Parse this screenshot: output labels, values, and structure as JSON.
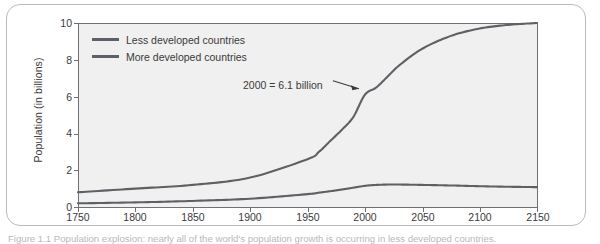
{
  "figure": {
    "caption": "Figure 1.1  Population explosion: nearly all of the world's population growth is occurring in less developed countries.",
    "frame_color": "#b9bcbe",
    "plot_background": "#f0f0f0",
    "axis_color": "#6e7073"
  },
  "chart_data": {
    "type": "line",
    "title": "",
    "xlabel": "",
    "ylabel": "Population (in billions)",
    "xlim": [
      1750,
      2150
    ],
    "ylim": [
      0,
      10
    ],
    "grid": false,
    "legend_position": "top-left",
    "xticks": [
      1750,
      1800,
      1850,
      1900,
      1950,
      2000,
      2050,
      2100,
      2150
    ],
    "yticks": [
      0,
      2,
      4,
      6,
      8,
      10
    ],
    "x": [
      1750,
      1800,
      1850,
      1900,
      1950,
      1960,
      1970,
      1980,
      1990,
      2000,
      2010,
      2020,
      2030,
      2050,
      2075,
      2100,
      2125,
      2150
    ],
    "series": [
      {
        "name": "Less developed countries",
        "color": "#5d6064",
        "values": [
          0.8,
          1.0,
          1.2,
          1.6,
          2.6,
          3.0,
          3.6,
          4.2,
          4.9,
          6.1,
          6.5,
          7.1,
          7.7,
          8.6,
          9.3,
          9.7,
          9.9,
          10.0
        ]
      },
      {
        "name": "More developed countries",
        "color": "#5d6064",
        "values": [
          0.2,
          0.25,
          0.33,
          0.45,
          0.7,
          0.78,
          0.86,
          0.95,
          1.05,
          1.15,
          1.2,
          1.22,
          1.22,
          1.2,
          1.17,
          1.13,
          1.1,
          1.08
        ]
      }
    ],
    "annotations": [
      {
        "text": "2000 = 6.1 billion",
        "x": 2000,
        "y": 6.1,
        "label_x": 1965,
        "label_y": 6.9
      }
    ]
  },
  "legend": {
    "items": [
      {
        "label": "Less developed countries"
      },
      {
        "label": "More developed countries"
      }
    ]
  },
  "axes": {
    "y_title": "Population (in billions)",
    "y_labels": [
      "10",
      "8",
      "6",
      "4",
      "2",
      "0"
    ],
    "x_labels": [
      "1750",
      "1800",
      "1850",
      "1900",
      "1950",
      "2000",
      "2050",
      "2100",
      "2150"
    ]
  }
}
